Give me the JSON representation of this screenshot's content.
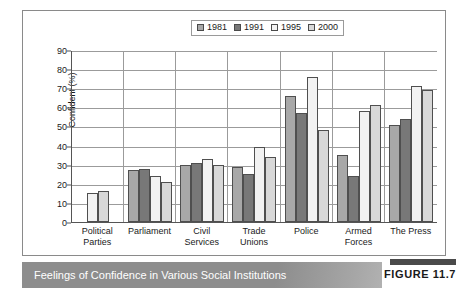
{
  "figure": {
    "caption": "Feelings of Confidence in Various Social Institutions",
    "badge_label": "FIGURE 11.7"
  },
  "colors": {
    "series_1981": "#a8a8a8",
    "series_1991": "#787878",
    "series_1995": "#f2f2f2",
    "series_2000": "#d8d8d8",
    "bar_outline": "#4f4f4f",
    "gridline": "#9b9b9b",
    "axis": "#555555",
    "caption_bar": "#8d8d8d",
    "caption_text": "#ffffff",
    "frame_border": "#8a8a8a"
  },
  "chart_data": {
    "type": "bar",
    "title": "",
    "xlabel": "",
    "ylabel": "Confident (%)",
    "ylim": [
      0,
      90
    ],
    "yticks": [
      0,
      10,
      20,
      30,
      40,
      50,
      60,
      70,
      80,
      90
    ],
    "ytick_labels": [
      "0",
      "10",
      "20",
      "30",
      "40",
      "50",
      "60",
      "70",
      "80",
      "90"
    ],
    "grid": true,
    "legend_position": "top-center",
    "categories": [
      "Political Parties",
      "Parliament",
      "Civil Services",
      "Trade Unions",
      "Police",
      "Armed Forces",
      "The Press"
    ],
    "category_lines": [
      [
        "Political",
        "Parties"
      ],
      [
        "Parliament"
      ],
      [
        "Civil",
        "Services"
      ],
      [
        "Trade",
        "Unions"
      ],
      [
        "Police"
      ],
      [
        "Armed",
        "Forces"
      ],
      [
        "The Press"
      ]
    ],
    "series": [
      {
        "name": "1981",
        "color": "#a8a8a8",
        "values": [
          null,
          27,
          30,
          29,
          66,
          35,
          51
        ]
      },
      {
        "name": "1991",
        "color": "#787878",
        "values": [
          null,
          28,
          31,
          25,
          57,
          24,
          54
        ]
      },
      {
        "name": "1995",
        "color": "#f2f2f2",
        "values": [
          15,
          24,
          33,
          39,
          76,
          58,
          71
        ]
      },
      {
        "name": "2000",
        "color": "#d8d8d8",
        "values": [
          16,
          21,
          30,
          34,
          48,
          61,
          69
        ]
      }
    ]
  }
}
